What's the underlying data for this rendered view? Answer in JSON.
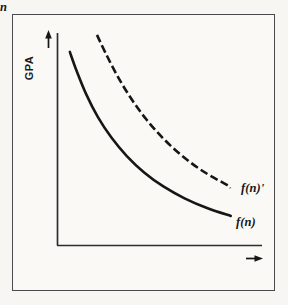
{
  "figure": {
    "background_color": "#f7f6f3",
    "frame_color": "#4b4b4d",
    "ink_color": "#161616"
  },
  "axes": {
    "y_label": "GPA",
    "y_arrow": "up-arrow",
    "x_label": "n",
    "x_arrow": "right-arrow"
  },
  "labels": {
    "dashed_curve": "f(n)'",
    "solid_curve": "f(n)"
  },
  "chart_data": {
    "type": "line",
    "title": "",
    "xlabel": "n",
    "ylabel": "GPA",
    "xlim": [
      0,
      1
    ],
    "ylim": [
      0,
      1
    ],
    "grid": false,
    "legend": "inline-right",
    "axis_arrows": true,
    "tick_labels": {
      "x": [],
      "y": []
    },
    "series": [
      {
        "name": "f(n)",
        "style": "solid",
        "color": "#161616",
        "width": 2.6,
        "points": [
          [
            0.064,
            0.911
          ],
          [
            0.1,
            0.82
          ],
          [
            0.15,
            0.71
          ],
          [
            0.21,
            0.604
          ],
          [
            0.28,
            0.508
          ],
          [
            0.36,
            0.421
          ],
          [
            0.45,
            0.344
          ],
          [
            0.55,
            0.278
          ],
          [
            0.66,
            0.222
          ],
          [
            0.78,
            0.175
          ],
          [
            0.9,
            0.139
          ]
        ]
      },
      {
        "name": "f(n)'",
        "style": "dashed",
        "color": "#161616",
        "width": 2.6,
        "dash_pattern": [
          8,
          3.5
        ],
        "points": [
          [
            0.205,
            0.991
          ],
          [
            0.25,
            0.905
          ],
          [
            0.31,
            0.8
          ],
          [
            0.38,
            0.695
          ],
          [
            0.46,
            0.595
          ],
          [
            0.55,
            0.503
          ],
          [
            0.65,
            0.42
          ],
          [
            0.76,
            0.347
          ],
          [
            0.88,
            0.285
          ],
          [
            0.9,
            0.272
          ]
        ]
      }
    ],
    "annotations": [
      {
        "text": "f(n)'",
        "attached_to": "f(n)'",
        "position": "right-end"
      },
      {
        "text": "f(n)",
        "attached_to": "f(n)",
        "position": "right-end"
      }
    ]
  }
}
